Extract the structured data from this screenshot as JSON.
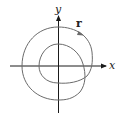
{
  "diagram": {
    "type": "parametric-curve-plot",
    "labels": {
      "x_axis": "x",
      "y_axis": "y",
      "curve": "r"
    },
    "colors": {
      "axis": "#1a1a1a",
      "curve": "#6b6b6b",
      "text": "#222222",
      "background": "#ffffff"
    }
  }
}
